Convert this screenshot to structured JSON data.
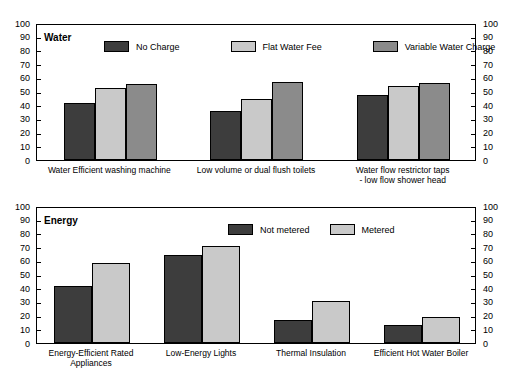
{
  "chart_data": [
    {
      "type": "bar",
      "title": "Water",
      "xlabel": "",
      "ylabel": "",
      "ylim": [
        0,
        100
      ],
      "yticks": [
        0,
        10,
        20,
        30,
        40,
        50,
        60,
        70,
        80,
        90,
        100
      ],
      "grid": false,
      "legend_position": "top-inside",
      "categories": [
        "Water Efficient washing machine",
        "Low volume or dual flush toilets",
        "Water flow restrictor taps\n- low flow shower head"
      ],
      "series": [
        {
          "name": "No Charge",
          "color": "#3d3d3d",
          "values": [
            42,
            36,
            48
          ]
        },
        {
          "name": "Flat Water Fee",
          "color": "#c9c9c9",
          "values": [
            53,
            45,
            55
          ]
        },
        {
          "name": "Variable Water Charge",
          "color": "#8b8b8b",
          "values": [
            56,
            58,
            57
          ]
        }
      ]
    },
    {
      "type": "bar",
      "title": "Energy",
      "xlabel": "",
      "ylabel": "",
      "ylim": [
        0,
        100
      ],
      "yticks": [
        0,
        10,
        20,
        30,
        40,
        50,
        60,
        70,
        80,
        90,
        100
      ],
      "grid": false,
      "legend_position": "top-inside",
      "categories": [
        "Energy-Efficient Rated\nAppliances",
        "Low-Energy Lights",
        "Thermal Insulation",
        "Efficient Hot Water Boiler"
      ],
      "series": [
        {
          "name": "Not metered",
          "color": "#3d3d3d",
          "values": [
            42,
            65,
            17,
            13
          ]
        },
        {
          "name": "Metered",
          "color": "#c9c9c9",
          "values": [
            59,
            72,
            31,
            19
          ]
        }
      ]
    }
  ]
}
